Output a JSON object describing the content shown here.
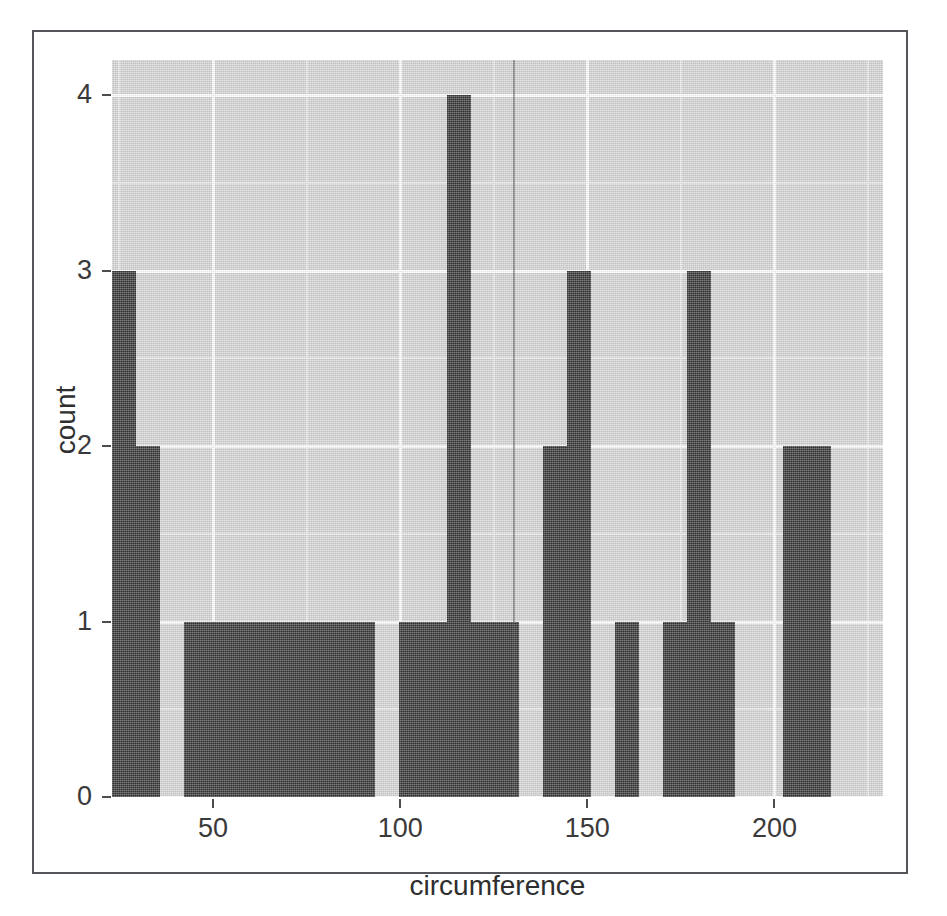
{
  "figure": {
    "kind": "histogram",
    "panel_background": "#d4d4d4",
    "bar_color": "#343434",
    "gridline_color": "#fdfdfd",
    "frame_color": "#54565c"
  },
  "axes": {
    "x": {
      "title": "circumference",
      "ticks": [
        50,
        100,
        150,
        200
      ],
      "tick_labels": [
        "50",
        "100",
        "150",
        "200"
      ],
      "range": [
        23,
        229
      ]
    },
    "y": {
      "title": "count",
      "ticks": [
        0,
        1,
        2,
        3,
        4
      ],
      "tick_labels": [
        "0",
        "1",
        "2",
        "3",
        "4"
      ],
      "range": [
        0,
        4.2
      ]
    }
  },
  "chart_data": {
    "type": "bar",
    "title": "",
    "subtitle": "",
    "xlabel": "circumference",
    "ylabel": "count",
    "xlim": [
      23,
      229
    ],
    "ylim": [
      0,
      4.2
    ],
    "grid": true,
    "legend": "none",
    "binwidth": 6.4,
    "categories": [
      "23.0",
      "29.4",
      "35.8",
      "42.2",
      "48.6",
      "55.0",
      "61.4",
      "67.8",
      "74.2",
      "80.6",
      "87.0",
      "93.4",
      "99.8",
      "106.2",
      "112.6",
      "119.0",
      "125.4",
      "131.8",
      "138.2",
      "144.6",
      "151.0",
      "157.4",
      "163.8",
      "170.2",
      "176.6",
      "183.0",
      "189.4",
      "195.8",
      "202.2",
      "208.6"
    ],
    "values": [
      3,
      2,
      0,
      1,
      1,
      1,
      1,
      1,
      1,
      1,
      1,
      0,
      1,
      1,
      4,
      1,
      1,
      0,
      2,
      3,
      0,
      1,
      0,
      1,
      3,
      1,
      0,
      0,
      2,
      2
    ],
    "bars": [
      {
        "x0": 23.0,
        "x1": 29.4,
        "count": 3
      },
      {
        "x0": 29.4,
        "x1": 35.8,
        "count": 2
      },
      {
        "x0": 35.8,
        "x1": 42.2,
        "count": 0
      },
      {
        "x0": 42.2,
        "x1": 93.4,
        "count": 1
      },
      {
        "x0": 93.4,
        "x1": 99.8,
        "count": 0
      },
      {
        "x0": 99.8,
        "x1": 112.6,
        "count": 1
      },
      {
        "x0": 112.6,
        "x1": 119.0,
        "count": 4
      },
      {
        "x0": 119.0,
        "x1": 131.8,
        "count": 1
      },
      {
        "x0": 131.8,
        "x1": 138.2,
        "count": 0
      },
      {
        "x0": 138.2,
        "x1": 144.6,
        "count": 2
      },
      {
        "x0": 144.6,
        "x1": 151.0,
        "count": 3
      },
      {
        "x0": 151.0,
        "x1": 157.4,
        "count": 0
      },
      {
        "x0": 157.4,
        "x1": 163.8,
        "count": 1
      },
      {
        "x0": 163.8,
        "x1": 170.2,
        "count": 0
      },
      {
        "x0": 170.2,
        "x1": 176.6,
        "count": 1
      },
      {
        "x0": 176.6,
        "x1": 183.0,
        "count": 3
      },
      {
        "x0": 183.0,
        "x1": 189.4,
        "count": 1
      },
      {
        "x0": 189.4,
        "x1": 202.2,
        "count": 0
      },
      {
        "x0": 202.2,
        "x1": 215.0,
        "count": 2
      }
    ],
    "gridlines": {
      "y_major": [
        0,
        1,
        2,
        3,
        4
      ],
      "y_minor": [
        0.5,
        1.5,
        2.5,
        3.5
      ],
      "x_major": [
        50,
        100,
        150,
        200
      ],
      "x_minor": [
        25,
        75,
        125,
        175,
        225
      ]
    }
  }
}
